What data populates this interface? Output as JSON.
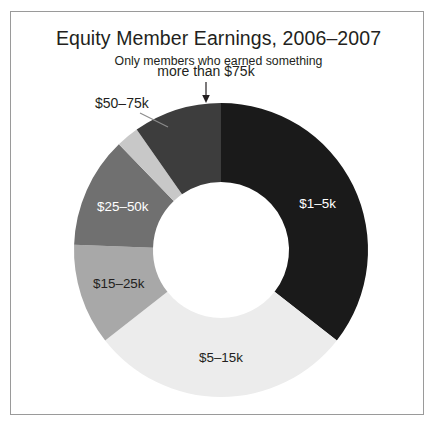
{
  "chart_data": {
    "type": "pie",
    "variant": "donut",
    "title": "Equity Member Earnings, 2006–2007",
    "subtitle": "Only members who earned something",
    "xlabel": "",
    "ylabel": "",
    "legend": "none",
    "grid": false,
    "start_angle_deg": 0,
    "direction": "clockwise",
    "categories": [
      "$1–5k",
      "$5–15k",
      "$15–25k",
      "$25–50k",
      "$50–75k",
      "more than $75k"
    ],
    "values": [
      35.5,
      29.0,
      11.0,
      12.0,
      2.5,
      10.0
    ],
    "units": "percent",
    "colors": [
      "#1a1a1a",
      "#ececec",
      "#a8a8a8",
      "#707070",
      "#c8c8c8",
      "#3d3d3d"
    ],
    "slices": [
      {
        "label": "$1–5k",
        "value": 35.5,
        "color": "#1a1a1a",
        "start_deg": 0,
        "end_deg": 128,
        "label_placement": "inside",
        "label_color": "#ffffff"
      },
      {
        "label": "$5–15k",
        "value": 29.0,
        "color": "#ececec",
        "start_deg": 128,
        "end_deg": 232,
        "label_placement": "inside",
        "label_color": "#231f20"
      },
      {
        "label": "$15–25k",
        "value": 11.0,
        "color": "#a8a8a8",
        "start_deg": 232,
        "end_deg": 272,
        "label_placement": "inside",
        "label_color": "#231f20"
      },
      {
        "label": "$25–50k",
        "value": 12.0,
        "color": "#707070",
        "start_deg": 272,
        "end_deg": 316,
        "label_placement": "inside",
        "label_color": "#ffffff"
      },
      {
        "label": "$50–75k",
        "value": 2.5,
        "color": "#c8c8c8",
        "start_deg": 316,
        "end_deg": 325,
        "label_placement": "outside-leader",
        "label_color": "#231f20"
      },
      {
        "label": "more than $75k",
        "value": 10.0,
        "color": "#3d3d3d",
        "start_deg": 325,
        "end_deg": 360,
        "label_placement": "outside-arrow",
        "label_color": "#231f20"
      }
    ]
  },
  "frame": {
    "border_color": "#9a9a9a",
    "background": "#ffffff"
  }
}
